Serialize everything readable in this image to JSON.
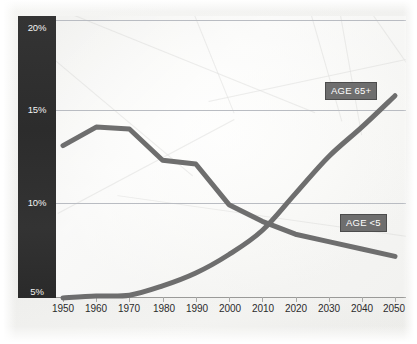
{
  "chart_data": {
    "type": "line",
    "title": "",
    "subtitle": "",
    "xlabel": "",
    "ylabel": "",
    "x": [
      1950,
      1960,
      1970,
      1980,
      1990,
      2000,
      2010,
      2020,
      2030,
      2040,
      2050
    ],
    "xlim": [
      1950,
      2050
    ],
    "ylim": [
      5,
      20
    ],
    "y_ticks": [
      5,
      10,
      15,
      20
    ],
    "y_tick_labels": [
      "5%",
      "10%",
      "15%",
      "20%"
    ],
    "x_tick_labels": [
      "1950",
      "1960",
      "1970",
      "1980",
      "1990",
      "2000",
      "2010",
      "2020",
      "2030",
      "2040",
      "2050"
    ],
    "grid": true,
    "legend_position": "inline-labels",
    "annotations": [
      "AGE 65+",
      "AGE <5"
    ],
    "series": [
      {
        "name": "AGE <5",
        "label": "AGE <5",
        "color": "#6e6e6e",
        "values": [
          13.2,
          14.2,
          14.1,
          12.4,
          12.2,
          10.0,
          9.1,
          8.4,
          8.0,
          7.6,
          7.2
        ]
      },
      {
        "name": "AGE 65+",
        "label": "AGE 65+",
        "color": "#6e6e6e",
        "values": [
          4.95,
          5.05,
          5.1,
          5.6,
          6.3,
          7.3,
          8.6,
          10.6,
          12.6,
          14.2,
          15.9
        ]
      }
    ]
  },
  "axis": {
    "y_band_color": "#2f2f2f",
    "y_tick_text_color": "#f2f2f2",
    "gridline_color": "#b9bcc2",
    "x_tick_text_color": "#2b2b2b"
  },
  "badges": {
    "age65": "AGE 65+",
    "age5": "AGE <5"
  }
}
